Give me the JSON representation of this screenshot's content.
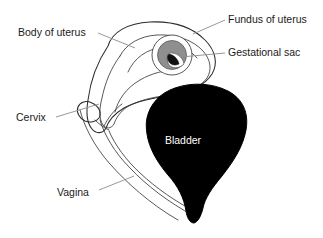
{
  "figure": {
    "width": 323,
    "height": 238,
    "background_color": "#ffffff"
  },
  "colors": {
    "background": "#ffffff",
    "outline": "#2b2b2b",
    "leader_line": "#8c8c8c",
    "label_text": "#1a1a1a",
    "uterus_fill": "#f4f4f4",
    "uterus_wall_fill": "#ededed",
    "gestational_sac_fill": "#8f8f8f",
    "gestational_sac_inner_fill": "#ffffff",
    "embryo_fill": "#000000",
    "bladder_fill": "#000000",
    "bladder_label_text": "#ffffff"
  },
  "labels": [
    {
      "id": "body-of-uterus",
      "text": "Body of uterus",
      "x": 18,
      "y": 33,
      "anchor": "start",
      "leader": "M98,33 L135,48"
    },
    {
      "id": "fundus-of-uterus",
      "text": "Fundus of uterus",
      "x": 228,
      "y": 20,
      "anchor": "start",
      "leader": "M225,20 L193,34"
    },
    {
      "id": "gestational-sac",
      "text": "Gestational sac",
      "x": 228,
      "y": 53,
      "anchor": "start",
      "leader": "M225,53 L181,57"
    },
    {
      "id": "cervix",
      "text": "Cervix",
      "x": 16,
      "y": 118,
      "anchor": "start",
      "leader": "M56,117 L99,104"
    },
    {
      "id": "vagina",
      "text": "Vagina",
      "x": 57,
      "y": 193,
      "anchor": "start",
      "leader": "M99,190 L134,176"
    }
  ],
  "inset_labels": [
    {
      "id": "bladder",
      "text": "Bladder",
      "x": 183,
      "y": 141
    }
  ],
  "anatomy": [
    {
      "id": "uterus-body",
      "name": "Body of uterus"
    },
    {
      "id": "uterus-fundus",
      "name": "Fundus of uterus"
    },
    {
      "id": "gestational-sac",
      "name": "Gestational sac"
    },
    {
      "id": "cervix",
      "name": "Cervix"
    },
    {
      "id": "vagina",
      "name": "Vagina"
    },
    {
      "id": "bladder",
      "name": "Bladder"
    }
  ]
}
